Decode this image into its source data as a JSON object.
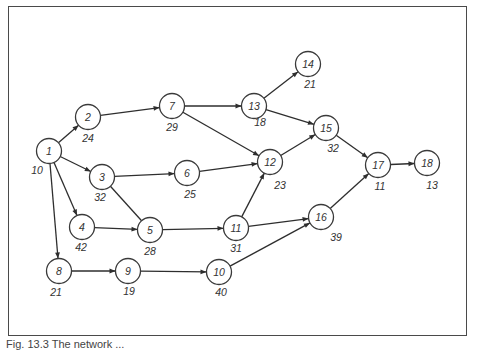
{
  "figure": {
    "caption": "Fig. 13.3 The network ..."
  },
  "chart_data": {
    "type": "network-diagram",
    "nodes": [
      {
        "id": "1",
        "duration": "10",
        "x": 49,
        "y": 151,
        "lx": 37,
        "ly": 170
      },
      {
        "id": "2",
        "duration": "24",
        "x": 88,
        "y": 117,
        "lx": 88,
        "ly": 138
      },
      {
        "id": "3",
        "duration": "32",
        "x": 102,
        "y": 177,
        "lx": 100,
        "ly": 197
      },
      {
        "id": "4",
        "duration": "42",
        "x": 82,
        "y": 227,
        "lx": 81,
        "ly": 247
      },
      {
        "id": "5",
        "duration": "28",
        "x": 150,
        "y": 230,
        "lx": 150,
        "ly": 251
      },
      {
        "id": "6",
        "duration": "25",
        "x": 187,
        "y": 173,
        "lx": 190,
        "ly": 194
      },
      {
        "id": "7",
        "duration": "29",
        "x": 172,
        "y": 106,
        "lx": 172,
        "ly": 127
      },
      {
        "id": "8",
        "duration": "21",
        "x": 59,
        "y": 271,
        "lx": 56,
        "ly": 292
      },
      {
        "id": "9",
        "duration": "19",
        "x": 128,
        "y": 271,
        "lx": 129,
        "ly": 291
      },
      {
        "id": "10",
        "duration": "40",
        "x": 219,
        "y": 272,
        "lx": 221,
        "ly": 292
      },
      {
        "id": "11",
        "duration": "31",
        "x": 236,
        "y": 228,
        "lx": 236,
        "ly": 248
      },
      {
        "id": "12",
        "duration": "23",
        "x": 270,
        "y": 162,
        "lx": 280,
        "ly": 185
      },
      {
        "id": "13",
        "duration": "18",
        "x": 254,
        "y": 106,
        "lx": 260,
        "ly": 122
      },
      {
        "id": "14",
        "duration": "21",
        "x": 308,
        "y": 64,
        "lx": 310,
        "ly": 84
      },
      {
        "id": "15",
        "duration": "32",
        "x": 326,
        "y": 128,
        "lx": 333,
        "ly": 148
      },
      {
        "id": "16",
        "duration": "39",
        "x": 321,
        "y": 217,
        "lx": 336,
        "ly": 237
      },
      {
        "id": "17",
        "duration": "11",
        "x": 378,
        "y": 165,
        "lx": 380,
        "ly": 186
      },
      {
        "id": "18",
        "duration": "13",
        "x": 427,
        "y": 163,
        "lx": 432,
        "ly": 185
      }
    ],
    "edges": [
      {
        "from": "1",
        "to": "2",
        "arrow": true
      },
      {
        "from": "1",
        "to": "3",
        "arrow": true
      },
      {
        "from": "1",
        "to": "4",
        "arrow": true
      },
      {
        "from": "1",
        "to": "8",
        "arrow": true
      },
      {
        "from": "2",
        "to": "7",
        "arrow": true
      },
      {
        "from": "3",
        "to": "6",
        "arrow": true
      },
      {
        "from": "3",
        "to": "5",
        "arrow": false
      },
      {
        "from": "4",
        "to": "5",
        "arrow": true
      },
      {
        "from": "5",
        "to": "11",
        "arrow": true
      },
      {
        "from": "6",
        "to": "12",
        "arrow": true
      },
      {
        "from": "7",
        "to": "13",
        "arrow": true
      },
      {
        "from": "7",
        "to": "12",
        "arrow": true
      },
      {
        "from": "8",
        "to": "9",
        "arrow": true
      },
      {
        "from": "9",
        "to": "10",
        "arrow": true
      },
      {
        "from": "10",
        "to": "16",
        "arrow": true
      },
      {
        "from": "11",
        "to": "12",
        "arrow": true
      },
      {
        "from": "11",
        "to": "16",
        "arrow": true
      },
      {
        "from": "12",
        "to": "15",
        "arrow": true
      },
      {
        "from": "13",
        "to": "14",
        "arrow": true
      },
      {
        "from": "13",
        "to": "15",
        "arrow": true
      },
      {
        "from": "15",
        "to": "17",
        "arrow": true
      },
      {
        "from": "16",
        "to": "17",
        "arrow": true
      },
      {
        "from": "17",
        "to": "18",
        "arrow": true
      }
    ],
    "title": "",
    "node_radius": 12.5,
    "colors": {
      "stroke": "#2e2e2e",
      "fill": "#ffffff",
      "text": "#333333",
      "frame": "#4a4a4a"
    }
  }
}
